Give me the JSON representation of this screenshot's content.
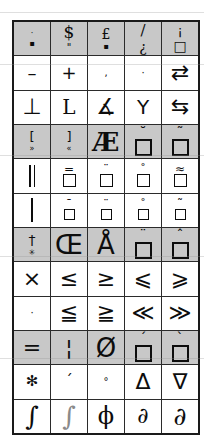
{
  "figure": {
    "kind": "glyph-grid",
    "columns": 5,
    "rows": 12,
    "shaded_rows": [
      0,
      2,
      4,
      6,
      8
    ],
    "border_color": "#1a1a1a",
    "shade_color": "#c8c8c8",
    "glyph_color": "#0d0d0d",
    "background": "#ffffff"
  },
  "grid": {
    "rows": [
      {
        "index": 0,
        "shaded": true,
        "cells": [
          {
            "name": "dot-over-square-mark",
            "glyph": "·",
            "sub": "▪"
          },
          {
            "name": "dollar-sign-with-double-quote",
            "glyph": "$",
            "sub": "\""
          },
          {
            "name": "pound-sign-with-mark",
            "glyph": "£",
            "sub": "▪"
          },
          {
            "name": "slash-over-inverted-question",
            "glyph": "/",
            "sub": "¿"
          },
          {
            "name": "inverted-exclamation-over-box",
            "glyph": "¡",
            "sub": "□"
          }
        ]
      },
      {
        "index": 1,
        "shaded": false,
        "cells": [
          {
            "name": "en-dash",
            "glyph": "–"
          },
          {
            "name": "plus-sign",
            "glyph": "+"
          },
          {
            "name": "comma",
            "glyph": ","
          },
          {
            "name": "middle-dot",
            "glyph": "·"
          },
          {
            "name": "rightwards-over-leftwards-arrow",
            "glyph": "⇄"
          }
        ]
      },
      {
        "index": 2,
        "shaded": false,
        "cells": [
          {
            "name": "up-tack",
            "glyph": "⊥"
          },
          {
            "name": "corner-left",
            "glyph": "L"
          },
          {
            "name": "angle-with-slash",
            "glyph": "∡"
          },
          {
            "name": "wye-junction",
            "glyph": "Y"
          },
          {
            "name": "leftwards-over-rightwards-arrow",
            "glyph": "⇆"
          }
        ]
      },
      {
        "index": 3,
        "shaded": true,
        "cells": [
          {
            "name": "left-bracket-with-right-guillemet",
            "glyph": "[",
            "sub": "»"
          },
          {
            "name": "right-bracket-with-left-guillemet",
            "glyph": "]",
            "sub": "«"
          },
          {
            "name": "ae-ligature-capital",
            "glyph": "Æ"
          },
          {
            "name": "box-with-breve",
            "glyph": "□",
            "acc": "˘"
          },
          {
            "name": "box-with-tilde",
            "glyph": "□",
            "acc": "˜"
          }
        ]
      },
      {
        "index": 4,
        "shaded": false,
        "cells": [
          {
            "name": "double-vertical-bar",
            "glyph": "‖"
          },
          {
            "name": "box-with-double-macron",
            "glyph": "□",
            "acc": "="
          },
          {
            "name": "box-with-diaeresis",
            "glyph": "□",
            "acc": "¨"
          },
          {
            "name": "box-with-ring-above",
            "glyph": "□",
            "acc": "˚"
          },
          {
            "name": "box-with-double-tilde",
            "glyph": "□",
            "acc": "≈"
          }
        ]
      },
      {
        "index": 5,
        "shaded": false,
        "cells": [
          {
            "name": "single-vertical-bar",
            "glyph": "|"
          },
          {
            "name": "box-with-macron",
            "glyph": "□",
            "acc": "¯"
          },
          {
            "name": "box-with-diaeresis-small",
            "glyph": "□",
            "acc": "¨"
          },
          {
            "name": "box-with-ring-small",
            "glyph": "□",
            "acc": "˚"
          },
          {
            "name": "box-with-tilde-small",
            "glyph": "□",
            "acc": "˜"
          }
        ]
      },
      {
        "index": 6,
        "shaded": true,
        "cells": [
          {
            "name": "dagger-over-asterisk",
            "glyph": "†",
            "sub": "✳"
          },
          {
            "name": "oe-ligature-capital",
            "glyph": "Œ"
          },
          {
            "name": "a-with-ring-above",
            "glyph": "Å"
          },
          {
            "name": "box-with-diaeresis-large",
            "glyph": "□",
            "acc": "¨"
          },
          {
            "name": "box-with-circumflex",
            "glyph": "□",
            "acc": "ˆ"
          }
        ]
      },
      {
        "index": 7,
        "shaded": false,
        "cells": [
          {
            "name": "multiplication-sign",
            "glyph": "×"
          },
          {
            "name": "less-than-or-equal",
            "glyph": "≤"
          },
          {
            "name": "greater-than-or-equal",
            "glyph": "≥"
          },
          {
            "name": "less-than-or-slanted-equal",
            "glyph": "⩽"
          },
          {
            "name": "greater-than-or-slanted-equal",
            "glyph": "⩾"
          }
        ]
      },
      {
        "index": 8,
        "shaded": false,
        "cells": [
          {
            "name": "middle-dot-small",
            "glyph": "·"
          },
          {
            "name": "less-than-over-double-line",
            "glyph": "≦"
          },
          {
            "name": "greater-than-over-double-line",
            "glyph": "≧"
          },
          {
            "name": "much-less-than",
            "glyph": "≪"
          },
          {
            "name": "much-greater-than",
            "glyph": "≫"
          }
        ]
      },
      {
        "index": 9,
        "shaded": true,
        "cells": [
          {
            "name": "equals-sign",
            "glyph": "="
          },
          {
            "name": "broken-vertical-bar",
            "glyph": "¦"
          },
          {
            "name": "o-with-stroke-capital",
            "glyph": "Ø"
          },
          {
            "name": "box-with-acute-accent",
            "glyph": "□",
            "acc": "´"
          },
          {
            "name": "box-with-grave-accent",
            "glyph": "□",
            "acc": "`"
          }
        ]
      },
      {
        "index": 10,
        "shaded": false,
        "cells": [
          {
            "name": "asterisk-operator",
            "glyph": "✻"
          },
          {
            "name": "acute-accent-standalone",
            "glyph": "´"
          },
          {
            "name": "degree-sign",
            "glyph": "°"
          },
          {
            "name": "increment-triangle",
            "glyph": "Δ"
          },
          {
            "name": "nabla-del",
            "glyph": "∇"
          }
        ]
      },
      {
        "index": 11,
        "shaded": false,
        "cells": [
          {
            "name": "integral-sign",
            "glyph": "∫"
          },
          {
            "name": "integral-sign-light",
            "glyph": "∫"
          },
          {
            "name": "phi-with-stroke",
            "glyph": "ϕ"
          },
          {
            "name": "partial-differential",
            "glyph": "∂"
          },
          {
            "name": "partial-differential-large",
            "glyph": "∂"
          }
        ]
      }
    ]
  }
}
